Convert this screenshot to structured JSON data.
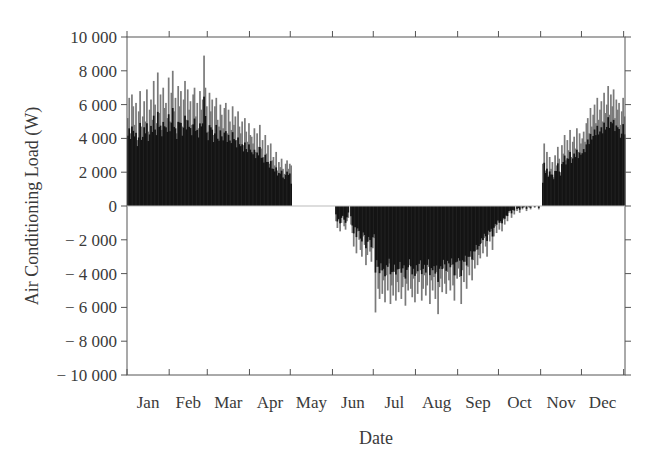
{
  "chart_data": {
    "type": "bar",
    "title": "",
    "xlabel": "Date",
    "ylabel": "Air Conditioning Load (W)",
    "ylim": [
      -10000,
      10000
    ],
    "yticks": [
      10000,
      8000,
      6000,
      4000,
      2000,
      0,
      -2000,
      -4000,
      -6000,
      -8000,
      -10000
    ],
    "ytick_labels": [
      "10 000",
      "8 000",
      "6 000",
      "4 000",
      "2 000",
      "0",
      "− 2 000",
      "− 4 000",
      "− 6 000",
      "− 8 000",
      "− 10 000"
    ],
    "categories": [
      "Jan",
      "Feb",
      "Mar",
      "Apr",
      "May",
      "Jun",
      "Jul",
      "Aug",
      "Sep",
      "Oct",
      "Nov",
      "Dec"
    ],
    "grid": false,
    "legend": null,
    "series_note": "Daily air conditioning load; positive = heating, negative = cooling. Dark core with lighter gray peaks.",
    "monthly_envelope": {
      "max": [
        8000,
        8900,
        6000,
        4900,
        0,
        0,
        0,
        0,
        0,
        0,
        4600,
        7100
      ],
      "min": [
        0,
        0,
        0,
        0,
        0,
        -3500,
        -6300,
        -6400,
        -5800,
        -900,
        0,
        0
      ]
    },
    "daily_values": [
      5200,
      6400,
      4300,
      6600,
      5900,
      4800,
      6100,
      3900,
      5600,
      6800,
      4700,
      5300,
      6200,
      5000,
      6900,
      4400,
      5700,
      6300,
      5100,
      7400,
      6000,
      4900,
      7900,
      5500,
      6600,
      4500,
      7000,
      5800,
      6100,
      5200,
      7600,
      5000,
      6700,
      8000,
      5600,
      6400,
      4300,
      7100,
      5900,
      6800,
      4700,
      6300,
      7400,
      5100,
      6900,
      5700,
      6200,
      4800,
      6600,
      7000,
      5300,
      6100,
      4600,
      6800,
      5700,
      6300,
      8900,
      7000,
      5900,
      4400,
      6700,
      5600,
      6300,
      4200,
      5900,
      6400,
      5100,
      4700,
      6000,
      5400,
      4600,
      5800,
      6100,
      4300,
      5700,
      5000,
      4500,
      5900,
      4800,
      5300,
      3900,
      5600,
      4700,
      4300,
      5000,
      3600,
      5200,
      4400,
      3800,
      4900,
      4200,
      4100,
      3700,
      4600,
      3200,
      4300,
      3500,
      4800,
      3400,
      3900,
      2900,
      4200,
      3100,
      3600,
      2500,
      3700,
      2700,
      2900,
      2400,
      3200,
      2100,
      2600,
      2300,
      2800,
      2200,
      1900,
      2500,
      2700,
      2200,
      2500,
      2400,
      0,
      0,
      0,
      0,
      0,
      0,
      0,
      0,
      0,
      0,
      0,
      0,
      0,
      0,
      0,
      0,
      0,
      0,
      0,
      0,
      0,
      0,
      0,
      0,
      0,
      0,
      0,
      0,
      0,
      0,
      0,
      0,
      -900,
      -1300,
      -800,
      -1500,
      -1000,
      -600,
      -1200,
      -1400,
      -900,
      -700,
      0,
      -1100,
      -1600,
      -2400,
      -1200,
      -2800,
      -1500,
      -2000,
      -2600,
      -3000,
      -1800,
      -2300,
      -3500,
      -2900,
      -2100,
      -2700,
      -3300,
      -2500,
      -1900,
      -6300,
      -3600,
      -4900,
      -5500,
      -3800,
      -5200,
      -4400,
      -5700,
      -4100,
      -5000,
      -3400,
      -5800,
      -4700,
      -5300,
      -3900,
      -5600,
      -4500,
      -5100,
      -3700,
      -5500,
      -4800,
      -4200,
      -5900,
      -4600,
      -5000,
      -3500,
      -4900,
      -5400,
      -4300,
      -5700,
      -4000,
      -5200,
      -4500,
      -3800,
      -5600,
      -4900,
      -4100,
      -5300,
      -4700,
      -3600,
      -5800,
      -4400,
      -5000,
      -4200,
      -5500,
      -3900,
      -6400,
      -4800,
      -4300,
      -5100,
      -3700,
      -4600,
      -5200,
      -3900,
      -4400,
      -5000,
      -3500,
      -4700,
      -5600,
      -4100,
      -4300,
      -3700,
      -4200,
      -5800,
      -3800,
      -4500,
      -3300,
      -4900,
      -3600,
      -4100,
      -3000,
      -4400,
      -3200,
      -3700,
      -2600,
      -3500,
      -2900,
      -3100,
      -2200,
      -2800,
      -1900,
      -2400,
      -3000,
      -1700,
      -2100,
      -1500,
      -2600,
      -1800,
      -1200,
      -1600,
      -900,
      -1400,
      -1000,
      -1500,
      -800,
      -1100,
      -600,
      -900,
      -400,
      -300,
      -700,
      -200,
      -500,
      0,
      -300,
      -100,
      -400,
      0,
      -200,
      -100,
      0,
      -300,
      0,
      -100,
      -200,
      0,
      0,
      -100,
      0,
      0,
      -200,
      0,
      0,
      2500,
      3700,
      2100,
      3200,
      1800,
      2900,
      2200,
      2600,
      1700,
      3000,
      2400,
      3500,
      2800,
      2000,
      3600,
      3100,
      4200,
      2700,
      3900,
      3300,
      4500,
      2900,
      3800,
      4100,
      3400,
      4600,
      3200,
      4300,
      3700,
      4000,
      4400,
      3800,
      4900,
      5200,
      4300,
      5800,
      4700,
      5400,
      6000,
      4900,
      6400,
      5100,
      5700,
      6200,
      5000,
      6700,
      5500,
      6000,
      7100,
      5400,
      6600,
      5900,
      6900,
      5200,
      6300,
      5700,
      6100,
      4800,
      5600,
      6400,
      5300
    ]
  },
  "plot_style": {
    "bar_dark": "#141414",
    "bar_light": "#7a7a7a",
    "axis_color": "#555555",
    "text_color": "#3a3a3a"
  }
}
